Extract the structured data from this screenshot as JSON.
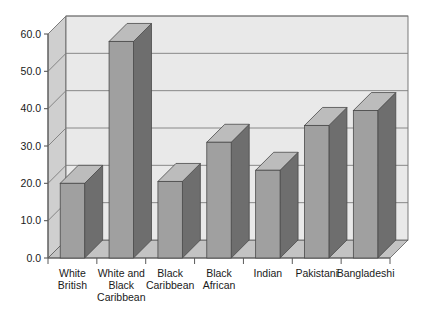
{
  "chart_data": {
    "type": "bar",
    "title": "",
    "subtitle": "",
    "xlabel": "",
    "ylabel": "",
    "categories": [
      "White British",
      "White and Black Caribbean",
      "Black Caribbean",
      "Black African",
      "Indian",
      "Pakistani",
      "Bangladeshi"
    ],
    "category_lines": [
      [
        "White",
        "British"
      ],
      [
        "White and",
        "Black",
        "Caribbean"
      ],
      [
        "Black",
        "Caribbean"
      ],
      [
        "Black",
        "African"
      ],
      [
        "Indian"
      ],
      [
        "Pakistani"
      ],
      [
        "Bangladeshi"
      ]
    ],
    "values": [
      20.0,
      58.0,
      20.5,
      31.0,
      23.5,
      35.5,
      39.5
    ],
    "ylim": [
      0.0,
      60.0
    ],
    "ytick_values": [
      0.0,
      10.0,
      20.0,
      30.0,
      40.0,
      50.0,
      60.0
    ],
    "ytick_labels": [
      "0.0",
      "10.0",
      "20.0",
      "30.0",
      "40.0",
      "50.0",
      "60.0"
    ],
    "grid": true,
    "grid_axis": "y",
    "legend": null,
    "legend_position": "none",
    "style": "3d-bar",
    "colors": {
      "bar_front": "#a0a0a0",
      "bar_side": "#6e6e6e",
      "bar_top": "#bcbcbc",
      "bar_outline": "#4a4a4a",
      "wall_back": "#e9e9e9",
      "wall_left": "#cfcfcf",
      "floor": "#c3c3c3",
      "gridline": "#7d7d7d",
      "axis": "#5a5a5a",
      "text": "#1a1a1a"
    }
  }
}
